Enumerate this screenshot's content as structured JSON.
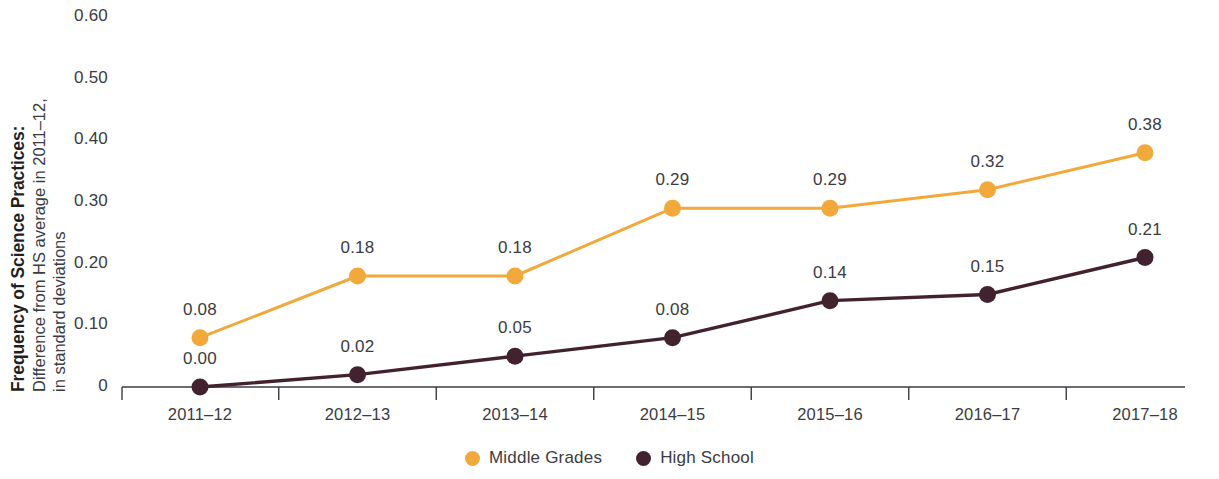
{
  "chart_data": {
    "type": "line",
    "title": "",
    "ylabel_bold": "Frequency of Science Practices:",
    "ylabel_sub_line1": "Difference from HS average in 2011–12,",
    "ylabel_sub_line2": "in standard deviations",
    "xlabel": "",
    "categories": [
      "2011–12",
      "2012–13",
      "2013–14",
      "2014–15",
      "2015–16",
      "2016–17",
      "2017–18"
    ],
    "ylim": [
      0,
      0.6
    ],
    "ytick_labels": [
      "0",
      "0.10",
      "0.20",
      "0.30",
      "0.40",
      "0.50",
      "0.60"
    ],
    "ytick_values": [
      0,
      0.1,
      0.2,
      0.3,
      0.4,
      0.5,
      0.6
    ],
    "grid": false,
    "legend_position": "bottom-center",
    "series": [
      {
        "name": "Middle Grades",
        "color": "#F2A93C",
        "values": [
          0.08,
          0.18,
          0.18,
          0.29,
          0.29,
          0.32,
          0.38
        ],
        "labels": [
          "0.08",
          "0.18",
          "0.18",
          "0.29",
          "0.29",
          "0.32",
          "0.38"
        ]
      },
      {
        "name": "High School",
        "color": "#42222F",
        "values": [
          0.0,
          0.02,
          0.05,
          0.08,
          0.14,
          0.15,
          0.21
        ],
        "labels": [
          "0.00",
          "0.02",
          "0.05",
          "0.08",
          "0.14",
          "0.15",
          "0.21"
        ]
      }
    ]
  },
  "legend": {
    "items": [
      {
        "label": "Middle Grades",
        "color": "#F2A93C",
        "icon": "circle-marker-icon"
      },
      {
        "label": "High School",
        "color": "#42222F",
        "icon": "circle-marker-icon"
      }
    ]
  },
  "axis": {
    "line_color": "#3b3b42",
    "tick_color": "#3b3b42"
  }
}
